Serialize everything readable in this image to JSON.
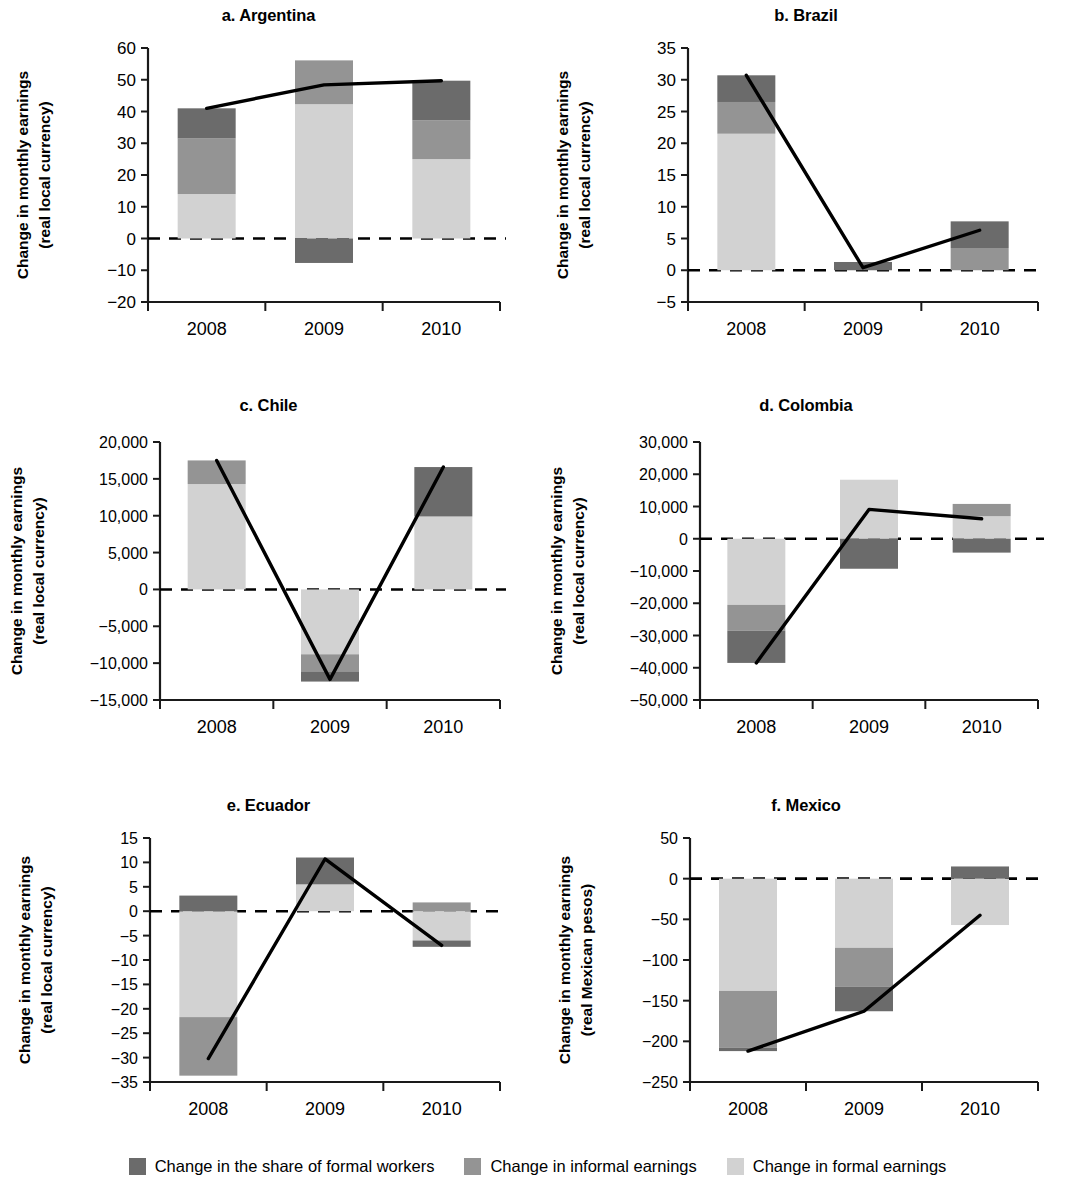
{
  "figure": {
    "legend": [
      {
        "key": "formal_share",
        "label": "Change in the share of formal workers",
        "color": "#6b6b6b"
      },
      {
        "key": "informal_earnings",
        "label": "Change in informal earnings",
        "color": "#949494"
      },
      {
        "key": "formal_earnings",
        "label": "Change in formal earnings",
        "color": "#d2d2d2"
      }
    ],
    "colors": {
      "formal_share": "#6b6b6b",
      "informal_earnings": "#949494",
      "formal_earnings": "#d2d2d2",
      "line": "#000000",
      "axis": "#1a1a1a",
      "zero_line": "#000000"
    }
  },
  "chart_data": [
    {
      "type": "bar",
      "panel": "a",
      "title": "a. Argentina",
      "ylabel": "Change in monthly earnings\n(real local currency)",
      "ylabel_line1": "Change in monthly earnings",
      "ylabel_line2": "(real local currency)",
      "xlabel": "",
      "categories": [
        "2008",
        "2009",
        "2010"
      ],
      "ylim": [
        -20,
        60
      ],
      "yticks": [
        -20,
        -10,
        0,
        10,
        20,
        30,
        40,
        50,
        60
      ],
      "yticklabels": [
        "−20",
        "−10",
        "0",
        "10",
        "20",
        "30",
        "40",
        "50",
        "60"
      ],
      "grid": false,
      "stacked": true,
      "series": [
        {
          "name": "Change in formal earnings",
          "key": "formal_earnings",
          "values": [
            14.0,
            42.3,
            25.0
          ]
        },
        {
          "name": "Change in informal earnings",
          "key": "informal_earnings",
          "values": [
            17.5,
            13.8,
            12.2
          ]
        },
        {
          "name": "Change in the share of formal workers",
          "key": "formal_share",
          "values": [
            9.5,
            -7.7,
            12.5
          ]
        }
      ],
      "line": {
        "name": "Total change",
        "values": [
          41.0,
          48.4,
          49.7
        ]
      }
    },
    {
      "type": "bar",
      "panel": "b",
      "title": "b. Brazil",
      "ylabel_line1": "Change in monthly earnings",
      "ylabel_line2": "(real local currency)",
      "categories": [
        "2008",
        "2009",
        "2010"
      ],
      "ylim": [
        -5,
        35
      ],
      "yticks": [
        -5,
        0,
        5,
        10,
        15,
        20,
        25,
        30,
        35
      ],
      "yticklabels": [
        "−5",
        "0",
        "5",
        "10",
        "15",
        "20",
        "25",
        "30",
        "35"
      ],
      "grid": false,
      "stacked": true,
      "series": [
        {
          "name": "Change in formal earnings",
          "key": "formal_earnings",
          "values": [
            21.5,
            0.0,
            0.0
          ]
        },
        {
          "name": "Change in informal earnings",
          "key": "informal_earnings",
          "values": [
            5.0,
            0.0,
            3.5
          ]
        },
        {
          "name": "Change in the share of formal workers",
          "key": "formal_share",
          "values": [
            4.2,
            1.3,
            4.2
          ]
        }
      ],
      "line": {
        "name": "Total change",
        "values": [
          30.7,
          0.4,
          6.3
        ]
      }
    },
    {
      "type": "bar",
      "panel": "c",
      "title": "c. Chile",
      "ylabel_line1": "Change in monthly earnings",
      "ylabel_line2": "(real local currency)",
      "categories": [
        "2008",
        "2009",
        "2010"
      ],
      "ylim": [
        -15000,
        20000
      ],
      "yticks": [
        -15000,
        -10000,
        -5000,
        0,
        5000,
        10000,
        15000,
        20000
      ],
      "yticklabels": [
        "−15,000",
        "−10,000",
        "−5,000",
        "0",
        "5,000",
        "10,000",
        "15,000",
        "20,000"
      ],
      "grid": false,
      "stacked": true,
      "series": [
        {
          "name": "Change in formal earnings",
          "key": "formal_earnings",
          "values": [
            14300,
            -8800,
            9900
          ]
        },
        {
          "name": "Change in informal earnings",
          "key": "informal_earnings",
          "values": [
            3200,
            -2400,
            0
          ]
        },
        {
          "name": "Change in the share of formal workers",
          "key": "formal_share",
          "values": [
            0,
            -1300,
            6700
          ]
        }
      ],
      "line": {
        "name": "Total change",
        "values": [
          17500,
          -12200,
          16600
        ]
      }
    },
    {
      "type": "bar",
      "panel": "d",
      "title": "d. Colombia",
      "ylabel_line1": "Change in monthly earnings",
      "ylabel_line2": "(real local currency)",
      "categories": [
        "2008",
        "2009",
        "2010"
      ],
      "ylim": [
        -50000,
        30000
      ],
      "yticks": [
        -50000,
        -40000,
        -30000,
        -20000,
        -10000,
        0,
        10000,
        20000,
        30000
      ],
      "yticklabels": [
        "−50,000",
        "−40,000",
        "−30,000",
        "−20,000",
        "−10,000",
        "0",
        "10,000",
        "20,000",
        "30,000"
      ],
      "grid": false,
      "stacked": true,
      "series": [
        {
          "name": "Change in formal earnings",
          "key": "formal_earnings",
          "values": [
            -20500,
            18300,
            7000
          ]
        },
        {
          "name": "Change in informal earnings",
          "key": "informal_earnings",
          "values": [
            -8000,
            0,
            3800
          ]
        },
        {
          "name": "Change in the share of formal workers",
          "key": "formal_share",
          "values": [
            -10000,
            -9300,
            -4300
          ]
        }
      ],
      "line": {
        "name": "Total change",
        "values": [
          -38500,
          9100,
          6200
        ]
      }
    },
    {
      "type": "bar",
      "panel": "e",
      "title": "e. Ecuador",
      "ylabel_line1": "Change in monthly earnings",
      "ylabel_line2": "(real local currency)",
      "categories": [
        "2008",
        "2009",
        "2010"
      ],
      "ylim": [
        -35,
        15
      ],
      "yticks": [
        -35,
        -30,
        -25,
        -20,
        -15,
        -10,
        -5,
        0,
        5,
        10,
        15
      ],
      "yticklabels": [
        "−35",
        "−30",
        "−25",
        "−20",
        "−15",
        "−10",
        "−5",
        "0",
        "5",
        "10",
        "15"
      ],
      "grid": false,
      "stacked": true,
      "series": [
        {
          "name": "Change in formal earnings",
          "key": "formal_earnings",
          "values": [
            -21.7,
            5.5,
            -6.0
          ]
        },
        {
          "name": "Change in informal earnings",
          "key": "informal_earnings",
          "values": [
            -12.0,
            0.0,
            1.8
          ]
        },
        {
          "name": "Change in the share of formal workers",
          "key": "formal_share",
          "values": [
            3.2,
            5.5,
            -1.3
          ]
        }
      ],
      "line": {
        "name": "Total change",
        "values": [
          -30.2,
          10.7,
          -7.0
        ]
      }
    },
    {
      "type": "bar",
      "panel": "f",
      "title": "f. Mexico",
      "ylabel_line1": "Change in monthly earnings",
      "ylabel_line2": "(real Mexican pesos)",
      "categories": [
        "2008",
        "2009",
        "2010"
      ],
      "ylim": [
        -250,
        50
      ],
      "yticks": [
        -250,
        -200,
        -150,
        -100,
        -50,
        0,
        50
      ],
      "yticklabels": [
        "−250",
        "−200",
        "−150",
        "−100",
        "−50",
        "0",
        "50"
      ],
      "grid": false,
      "stacked": true,
      "series": [
        {
          "name": "Change in formal earnings",
          "key": "formal_earnings",
          "values": [
            -138,
            -85,
            -57
          ]
        },
        {
          "name": "Change in informal earnings",
          "key": "informal_earnings",
          "values": [
            -70,
            -48,
            0
          ]
        },
        {
          "name": "Change in the share of formal workers",
          "key": "formal_share",
          "values": [
            -4,
            -30,
            15
          ]
        }
      ],
      "line": {
        "name": "Total change",
        "values": [
          -212,
          -163,
          -45
        ]
      }
    }
  ]
}
